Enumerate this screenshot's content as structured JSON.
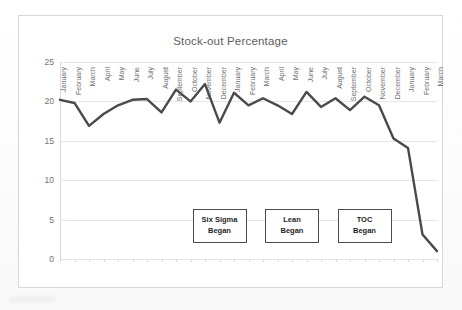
{
  "chart_data": {
    "type": "line",
    "title": "Stock-out Percentage",
    "xlabel": "",
    "ylabel": "",
    "ylim": [
      0,
      25
    ],
    "yticks": [
      0,
      5,
      10,
      15,
      20,
      25
    ],
    "grid": true,
    "legend": false,
    "line_color": "#4a4a4a",
    "categories": [
      "January",
      "February",
      "March",
      "April",
      "May",
      "June",
      "July",
      "August",
      "September",
      "October",
      "November",
      "December",
      "January",
      "February",
      "March",
      "April",
      "May",
      "June",
      "July",
      "August",
      "September",
      "October",
      "November",
      "December",
      "January",
      "February",
      "March"
    ],
    "values": [
      20.2,
      19.8,
      16.9,
      18.4,
      19.5,
      20.2,
      20.3,
      18.6,
      21.5,
      20.0,
      22.2,
      17.3,
      21.1,
      19.5,
      20.4,
      19.5,
      18.4,
      21.2,
      19.3,
      20.4,
      18.9,
      20.6,
      19.5,
      15.3,
      14.1,
      3.1,
      1.0
    ],
    "annotations": [
      {
        "label_line1": "Six Sigma",
        "label_line2": "Began",
        "category_index": 11,
        "y": 4.2
      },
      {
        "label_line1": "Lean",
        "label_line2": "Began",
        "category_index": 16,
        "y": 4.2
      },
      {
        "label_line1": "TOC",
        "label_line2": "Began",
        "category_index": 21,
        "y": 4.2
      }
    ]
  }
}
